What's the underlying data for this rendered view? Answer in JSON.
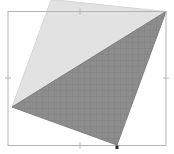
{
  "viewport": {
    "name": "geometry-viewport",
    "width": 174,
    "height": 154,
    "background_color": "#ffffff"
  },
  "frame": {
    "label": "bounding-box-frame",
    "stroke_color": "#b4b4b4",
    "stroke_width": 1,
    "x": 8,
    "y": 11.5,
    "width": 158,
    "height": 134,
    "ticks": [
      {
        "label": "top-midpoint-tick",
        "edge": "top",
        "x": 80,
        "y": 11.5
      },
      {
        "label": "left-midpoint-tick",
        "edge": "left",
        "x": 8,
        "y": 78
      },
      {
        "label": "right-midpoint-tick",
        "edge": "right",
        "x": 166,
        "y": 78
      },
      {
        "label": "bottom-midpoint-tick",
        "edge": "bottom",
        "x": 80,
        "y": 145.5
      }
    ]
  },
  "shapes": [
    {
      "label": "light-quadrilateral",
      "fill_color": "#e2e2e2",
      "stroke_color": "#d2d2d2",
      "points": "56,0 166,11.5 12,107 51,0"
    },
    {
      "label": "dark-hatched-quadrilateral",
      "fill_color": "#8d8d8d",
      "stroke_color": "#7d7d7d",
      "hatch_color": "#7f7f7f",
      "points": "166,11.5 117,145 12,107"
    }
  ],
  "markers": [
    {
      "label": "vertex-marker",
      "color": "#2b2b2b",
      "x": 117,
      "y": 147,
      "size": 3
    }
  ]
}
